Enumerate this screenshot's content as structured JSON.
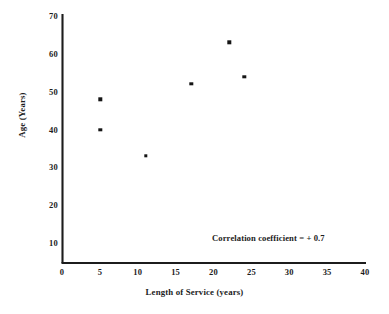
{
  "chart_data": {
    "type": "scatter",
    "title": "",
    "xlabel": "Length of Service (years)",
    "ylabel": "Age (Years)",
    "xlim": [
      0,
      40
    ],
    "ylim": [
      0,
      70
    ],
    "xticks": [
      "0",
      "5",
      "10",
      "15",
      "20",
      "25",
      "30",
      "35",
      "40"
    ],
    "yticks": [
      "10",
      "20",
      "30",
      "40",
      "50",
      "60",
      "70"
    ],
    "grid": false,
    "legend": "none",
    "series": [
      {
        "name": "Employees",
        "points": [
          {
            "x": 5,
            "y": 48
          },
          {
            "x": 5,
            "y": 40
          },
          {
            "x": 11,
            "y": 33
          },
          {
            "x": 17,
            "y": 52
          },
          {
            "x": 22,
            "y": 63
          },
          {
            "x": 24,
            "y": 54
          }
        ]
      }
    ],
    "annotations": [
      {
        "text": "Correlation coefficient = + 0.7",
        "x": 20,
        "y": 12
      }
    ],
    "marker_color": "#151515",
    "axis_color": "#1c1c1c"
  },
  "footer": {
    "mark": ""
  }
}
